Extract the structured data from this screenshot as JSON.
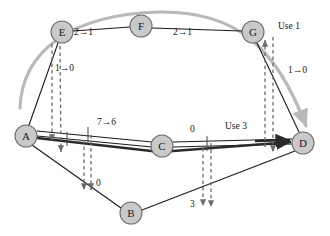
{
  "diagram": {
    "colors": {
      "node_fill": "#c9c9c9",
      "node_stroke": "#6e6e6e",
      "edge": "#1a1a1a",
      "augment_path": "#2a2a2a",
      "dashed_cut": "#6b6b6b",
      "swoosh": "#b9b9b9",
      "background": "#ffffff"
    },
    "nodes": [
      {
        "id": "A",
        "label": "A",
        "cx": 26,
        "cy": 136,
        "r": 11
      },
      {
        "id": "B",
        "label": "B",
        "cx": 131,
        "cy": 213,
        "r": 11
      },
      {
        "id": "C",
        "label": "C",
        "cx": 162,
        "cy": 146,
        "r": 11
      },
      {
        "id": "D",
        "label": "D",
        "cx": 303,
        "cy": 143,
        "r": 11
      },
      {
        "id": "E",
        "label": "E",
        "cx": 62,
        "cy": 32,
        "r": 11
      },
      {
        "id": "F",
        "label": "F",
        "cx": 141,
        "cy": 26,
        "r": 11
      },
      {
        "id": "G",
        "label": "G",
        "cx": 253,
        "cy": 32,
        "r": 11
      }
    ],
    "edge_labels": [
      {
        "id": "label-ef",
        "text": "2→1",
        "x": 84,
        "y": 33
      },
      {
        "id": "label-fg",
        "text": "2→1",
        "x": 183,
        "y": 33
      },
      {
        "id": "label-use-1",
        "text": "Use 1",
        "x": 278,
        "y": 28
      },
      {
        "id": "label-gd",
        "text": "1→0",
        "x": 290,
        "y": 72
      },
      {
        "id": "label-ae",
        "text": "1→0",
        "x": 57,
        "y": 70
      },
      {
        "id": "label-ac",
        "text": "7→6",
        "x": 104,
        "y": 123
      },
      {
        "id": "label-cd",
        "text": "0",
        "x": 192,
        "y": 130
      },
      {
        "id": "label-use-3",
        "text": "Use 3",
        "x": 232,
        "y": 126
      },
      {
        "id": "label-ab",
        "text": "0",
        "x": 97,
        "y": 184
      },
      {
        "id": "label-bd",
        "text": "3",
        "x": 191,
        "y": 205
      }
    ],
    "edges": [
      {
        "id": "edge-e-f",
        "from": "E",
        "to": "F",
        "style": "solid"
      },
      {
        "id": "edge-f-g",
        "from": "F",
        "to": "G",
        "style": "solid"
      },
      {
        "id": "edge-a-e",
        "from": "A",
        "to": "E",
        "style": "solid"
      },
      {
        "id": "edge-g-d",
        "from": "G",
        "to": "D",
        "style": "solid"
      },
      {
        "id": "edge-a-b",
        "from": "A",
        "to": "B",
        "style": "solid"
      },
      {
        "id": "edge-b-d",
        "from": "B",
        "to": "D",
        "style": "solid"
      },
      {
        "id": "edge-a-c",
        "from": "A",
        "to": "C",
        "style": "double-thick"
      },
      {
        "id": "edge-c-d",
        "from": "C",
        "to": "D",
        "style": "double-thick"
      },
      {
        "id": "edge-a-d-lower",
        "from": "A",
        "to": "D",
        "style": "thick-augment"
      }
    ],
    "cut_indicators": [
      {
        "id": "cut-ae-left",
        "arrow": "down"
      },
      {
        "id": "cut-ae-right",
        "arrow": "down"
      },
      {
        "id": "cut-ab",
        "arrow": "down"
      },
      {
        "id": "cut-bd",
        "arrow": "down"
      },
      {
        "id": "cut-cd",
        "arrow": "down"
      },
      {
        "id": "cut-gd-left",
        "arrow": "up"
      },
      {
        "id": "cut-gd-right",
        "arrow": "down"
      }
    ],
    "swoosh": {
      "id": "augment-swoosh",
      "description": "gray curved arrow from lower-left arcing over the top to node D"
    }
  }
}
